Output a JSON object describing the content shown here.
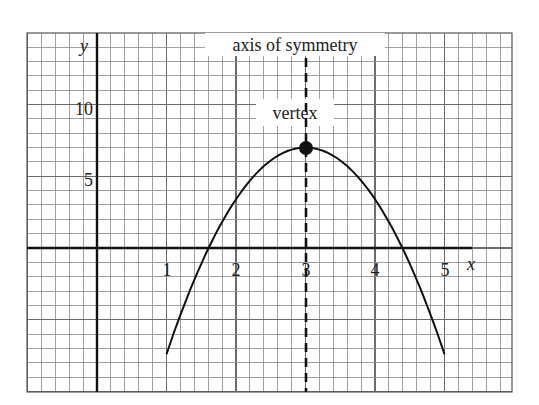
{
  "chart_data": {
    "type": "line",
    "title": "",
    "xlabel": "x",
    "ylabel": "y",
    "xlim": [
      -1.0,
      5.97
    ],
    "ylim": [
      -10.0,
      15.1
    ],
    "x_ticks": [
      1,
      2,
      3,
      4,
      5
    ],
    "x_tick_labels": [
      "1",
      "2",
      "3",
      "4",
      "5"
    ],
    "y_ticks": [
      5,
      10
    ],
    "y_tick_labels": [
      "5",
      "10"
    ],
    "grid": true,
    "grid_minor_x_step": 0.2,
    "grid_minor_y_step": 1,
    "series": [
      {
        "name": "parabola",
        "equation": "y = -3.6(x - 3)^2 + 7",
        "x": [
          1.0,
          1.5,
          1.61,
          2.0,
          2.5,
          3.0,
          3.5,
          4.0,
          4.39,
          4.5,
          5.0
        ],
        "y": [
          -7.4,
          -1.1,
          0.0,
          3.4,
          6.1,
          7.0,
          6.1,
          3.4,
          0.0,
          -1.1,
          -7.4
        ]
      }
    ],
    "vertex": {
      "x": 3,
      "y": 7
    },
    "axis_of_symmetry": {
      "x": 3
    },
    "annotations": [
      {
        "text": "axis of symmetry",
        "target": "dashed line x = 3"
      },
      {
        "text": "vertex",
        "target": "point (3, 7)"
      }
    ]
  },
  "labels": {
    "axis_of_symmetry": "axis of symmetry",
    "vertex": "vertex",
    "x_axis": "x",
    "y_axis": "y",
    "x_ticks": [
      "1",
      "2",
      "3",
      "4",
      "5"
    ],
    "y_ticks": [
      "10",
      "5"
    ]
  },
  "colors": {
    "grid": "#6b6b6b",
    "axis": "#111111",
    "curve": "#111111",
    "background": "#ffffff"
  }
}
